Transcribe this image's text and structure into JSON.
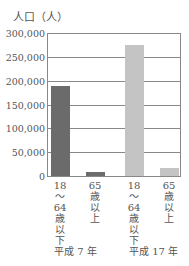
{
  "chart_data": {
    "type": "bar",
    "title": "",
    "ylabel": "人口（人）",
    "xlabel": "",
    "ylim": [
      0,
      300000
    ],
    "yticks": [
      "300,000",
      "250,000",
      "200,000",
      "150,000",
      "100,000",
      "50,000",
      "0"
    ],
    "grid": true,
    "categories": [
      "18〜64歳以下 (平成7年)",
      "65歳以上 (平成7年)",
      "18〜64歳以下 (平成17年)",
      "65歳以上 (平成17年)"
    ],
    "category_labels": [
      "18\n〜\n64\n歳\n以\n下",
      "65\n歳\n以\n上",
      "18\n〜\n64\n歳\n以\n下",
      "65\n歳\n以\n上"
    ],
    "groups": [
      "平成 7 年",
      "平成 17 年"
    ],
    "values": [
      188000,
      9000,
      274000,
      17000
    ],
    "colors": [
      "#6b6b6b",
      "#6b6b6b",
      "#c4c4c4",
      "#c4c4c4"
    ]
  },
  "labels": {
    "ylabel": "人口（人）",
    "ticks": [
      "300,000",
      "250,000",
      "200,000",
      "150,000",
      "100,000",
      "50,000",
      "0"
    ],
    "cats": [
      "18\n〜\n64\n歳\n以\n下",
      "65\n歳\n以\n上",
      "18\n〜\n64\n歳\n以\n下",
      "65\n歳\n以\n上"
    ],
    "group1": "平成 7 年",
    "group2": "平成 17 年"
  }
}
